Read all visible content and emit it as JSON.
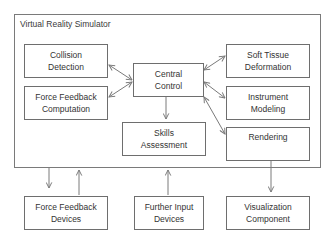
{
  "diagram": {
    "container": {
      "title": "Virtual Reality Simulator"
    },
    "nodes": [
      {
        "id": "collision-detection",
        "label_line1": "Collision",
        "label_line2": "Detection"
      },
      {
        "id": "force-feedback-computation",
        "label_line1": "Force Feedback",
        "label_line2": "Computation"
      },
      {
        "id": "central-control",
        "label_line1": "Central",
        "label_line2": "Control"
      },
      {
        "id": "skills-assessment",
        "label_line1": "Skills",
        "label_line2": "Assessment"
      },
      {
        "id": "soft-tissue-deformation",
        "label_line1": "Soft Tissue",
        "label_line2": "Deformation"
      },
      {
        "id": "instrument-modeling",
        "label_line1": "Instrument",
        "label_line2": "Modeling"
      },
      {
        "id": "rendering",
        "label_line1": "Rendering",
        "label_line2": ""
      },
      {
        "id": "force-feedback-devices",
        "label_line1": "Force Feedback",
        "label_line2": "Devices"
      },
      {
        "id": "further-input-devices",
        "label_line1": "Further Input",
        "label_line2": "Devices"
      },
      {
        "id": "visualization-component",
        "label_line1": "Visualization",
        "label_line2": "Component"
      }
    ],
    "edges": [
      {
        "from": "central-control",
        "to": "collision-detection",
        "bidirectional": true
      },
      {
        "from": "central-control",
        "to": "force-feedback-computation",
        "bidirectional": true
      },
      {
        "from": "central-control",
        "to": "soft-tissue-deformation",
        "bidirectional": true
      },
      {
        "from": "central-control",
        "to": "instrument-modeling",
        "bidirectional": true
      },
      {
        "from": "central-control",
        "to": "rendering",
        "bidirectional": true
      },
      {
        "from": "central-control",
        "to": "skills-assessment",
        "bidirectional": false
      },
      {
        "from": "virtual-reality-simulator",
        "to": "force-feedback-devices",
        "bidirectional": false
      },
      {
        "from": "force-feedback-devices",
        "to": "virtual-reality-simulator",
        "bidirectional": false
      },
      {
        "from": "further-input-devices",
        "to": "virtual-reality-simulator",
        "bidirectional": false
      },
      {
        "from": "rendering",
        "to": "visualization-component",
        "bidirectional": false
      }
    ],
    "colors": {
      "stroke": "#6e6e6e",
      "arrow": "#7a7a7a",
      "text": "#333333",
      "background": "#ffffff"
    }
  }
}
